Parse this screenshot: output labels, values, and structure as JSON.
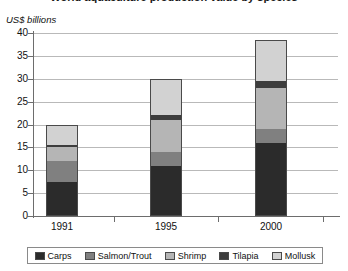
{
  "chart_data": {
    "type": "bar",
    "subtype": "stacked-bar",
    "title": "World aquaculture production value by species",
    "subtitle": "",
    "xlabel": "",
    "ylabel": "US$ billions",
    "ylim": [
      0,
      40
    ],
    "ytick_step": 5,
    "yticks": [
      "40",
      "35",
      "30",
      "25",
      "20",
      "15",
      "10",
      "5",
      "0"
    ],
    "grid": true,
    "legend_position": "bottom",
    "categories": [
      "1991",
      "1995",
      "2000"
    ],
    "series": [
      {
        "name": "Carps",
        "color": "#2b2b2b",
        "values": [
          7.5,
          11.0,
          16.0
        ]
      },
      {
        "name": "Salmon/Trout",
        "color": "#808080",
        "values": [
          4.5,
          3.0,
          3.0
        ]
      },
      {
        "name": "Shrimp",
        "color": "#b5b5b5",
        "values": [
          3.0,
          7.0,
          9.0
        ]
      },
      {
        "name": "Tilapia",
        "color": "#3d3d3d",
        "values": [
          0.5,
          1.0,
          1.5
        ]
      },
      {
        "name": "Mollusk",
        "color": "#d2d2d2",
        "values": [
          4.5,
          8.0,
          9.0
        ]
      }
    ],
    "totals": [
      20.0,
      30.0,
      38.5
    ]
  },
  "legend": {
    "entries": [
      {
        "label": "Carps"
      },
      {
        "label": "Salmon/Trout"
      },
      {
        "label": "Shrimp"
      },
      {
        "label": "Tilapia"
      },
      {
        "label": "Mollusk"
      }
    ]
  }
}
